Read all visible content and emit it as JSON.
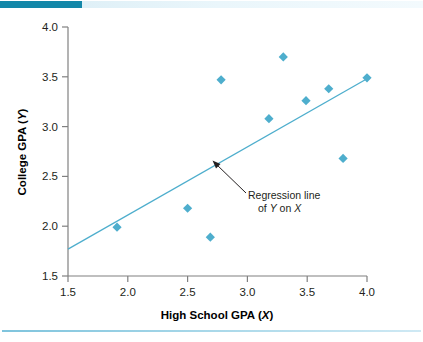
{
  "figure": {
    "background_color": "#ffffff",
    "accent_bar_color": "#1387a8",
    "footer_rule_color": "#7fc4dd"
  },
  "chart_data": {
    "type": "scatter",
    "title": "",
    "xlabel_text": "High School GPA (",
    "xlabel_var": "X",
    "xlabel_close": ")",
    "ylabel_text": "College GPA (",
    "ylabel_var": "Y",
    "ylabel_close": ")",
    "xlabel": "High School GPA (X)",
    "ylabel": "College GPA (Y)",
    "xlim": [
      1.5,
      4.0
    ],
    "ylim": [
      1.5,
      4.0
    ],
    "xticks": [
      "1.5",
      "2.0",
      "2.5",
      "3.0",
      "3.5",
      "4.0"
    ],
    "xtick_values": [
      1.5,
      2.0,
      2.5,
      3.0,
      3.5,
      4.0
    ],
    "yticks": [
      "1.5",
      "2.0",
      "2.5",
      "3.0",
      "3.5",
      "4.0"
    ],
    "ytick_values": [
      1.5,
      2.0,
      2.5,
      3.0,
      3.5,
      4.0
    ],
    "grid": false,
    "legend": false,
    "marker": "diamond",
    "marker_color": "#4eaecd",
    "line_color": "#4eaecd",
    "axis_color": "#808080",
    "points": [
      {
        "x": 1.91,
        "y": 1.99
      },
      {
        "x": 2.5,
        "y": 2.18
      },
      {
        "x": 2.69,
        "y": 1.89
      },
      {
        "x": 2.78,
        "y": 3.47
      },
      {
        "x": 3.18,
        "y": 3.08
      },
      {
        "x": 3.3,
        "y": 3.7
      },
      {
        "x": 3.49,
        "y": 3.26
      },
      {
        "x": 3.68,
        "y": 3.38
      },
      {
        "x": 3.8,
        "y": 2.68
      },
      {
        "x": 4.0,
        "y": 3.49
      }
    ],
    "regression_line": {
      "x1": 1.5,
      "y1": 1.77,
      "x2": 4.0,
      "y2": 3.48,
      "label_line1": "Regression line",
      "label_line2_pre": "of ",
      "label_line2_var1": "Y",
      "label_line2_mid": " on ",
      "label_line2_var2": "X",
      "label": "Regression line of Y on X"
    }
  }
}
